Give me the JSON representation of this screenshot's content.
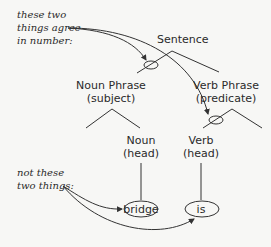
{
  "annotations": {
    "agree": [
      "these two",
      "things agree",
      "in number:"
    ],
    "not_agree": [
      "not these",
      "two things:"
    ]
  },
  "tree": {
    "root": "Sentence",
    "noun_phrase": [
      "Noun Phrase",
      "(subject)"
    ],
    "verb_phrase": [
      "Verb Phrase",
      "(predicate)"
    ],
    "noun_head": [
      "Noun",
      "(head)"
    ],
    "verb_head": [
      "Verb",
      "(head)"
    ],
    "leaf_noun": "bridge",
    "leaf_verb": "is"
  }
}
